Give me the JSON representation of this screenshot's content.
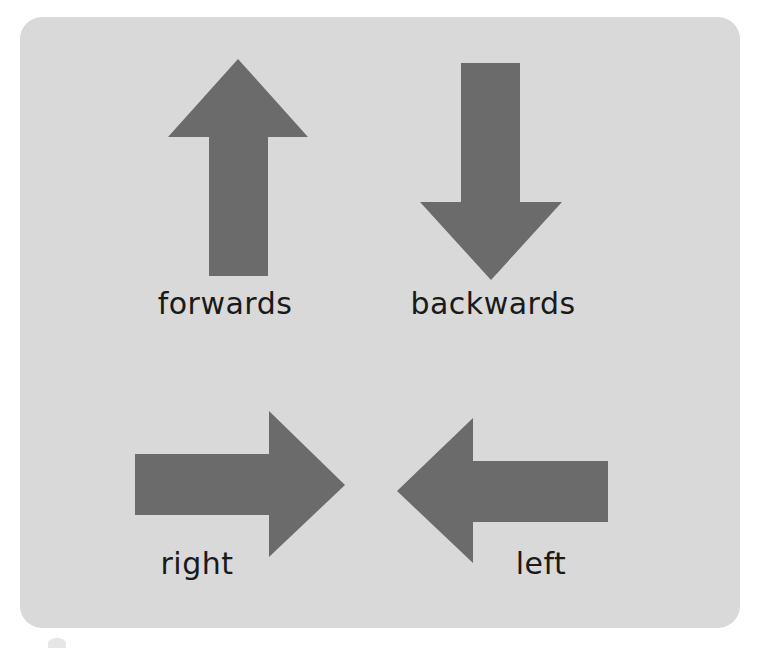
{
  "colors": {
    "background": "#ffffff",
    "card": "#d9d9d9",
    "arrow": "#6b6b6b",
    "text": "#1a1a1a"
  },
  "arrows": [
    {
      "direction": "up",
      "label": "forwards",
      "icon": "arrow-up-icon"
    },
    {
      "direction": "down",
      "label": "backwards",
      "icon": "arrow-down-icon"
    },
    {
      "direction": "right",
      "label": "right",
      "icon": "arrow-right-icon"
    },
    {
      "direction": "left",
      "label": "left",
      "icon": "arrow-left-icon"
    }
  ]
}
